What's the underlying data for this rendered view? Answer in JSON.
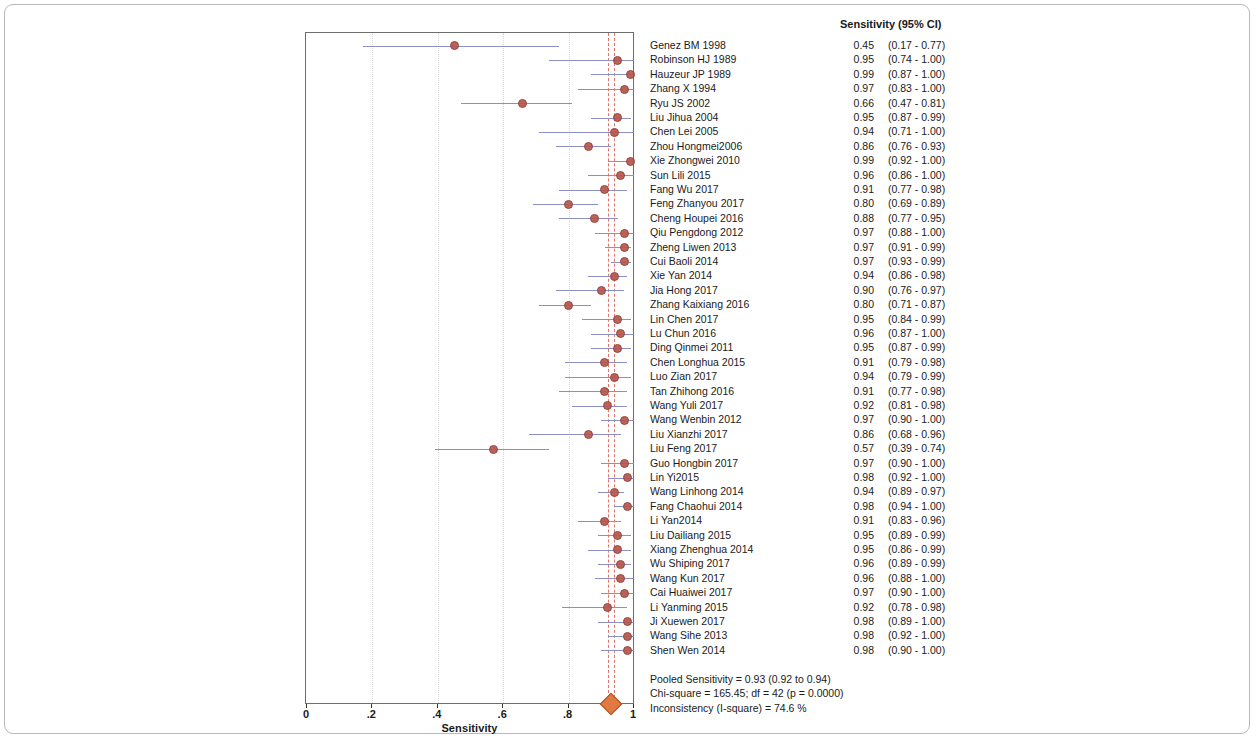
{
  "axis": {
    "title": "Sensitivity",
    "min": 0,
    "max": 1,
    "ticks": [
      "0",
      ".2",
      ".4",
      ".6",
      ".8",
      "1"
    ],
    "tick_values": [
      0,
      0.2,
      0.4,
      0.6,
      0.8,
      1
    ]
  },
  "table": {
    "header": "Sensitivity (95% CI)"
  },
  "colors": {
    "marker": "#b6564c",
    "ci_line": "#8b8fc4",
    "ref_line": "#e0736a",
    "diamond": "#e07a42",
    "frame": "#6d6d6d"
  },
  "summary": {
    "pooled": "Pooled Sensitivity = 0.93 (0.92 to 0.94)",
    "chisq": "Chi-square = 165.45; df =  42 (p = 0.0000)",
    "isquare": "Inconsistency (I-square) = 74.6 %"
  },
  "pooled_marker": {
    "value": 0.93,
    "low": 0.92,
    "high": 0.94
  },
  "ref_lines": [
    0.92,
    0.94
  ],
  "chart_data": {
    "type": "forest",
    "title": "Sensitivity (95% CI)",
    "xlabel": "Sensitivity",
    "ylabel": "",
    "xlim": [
      0,
      1
    ],
    "grid": true,
    "legend": "none",
    "categories": [
      "Genez BM 1998",
      "Robinson HJ 1989",
      "Hauzeur JP 1989",
      "Zhang X 1994",
      "Ryu JS 2002",
      "Liu Jihua 2004",
      "Chen Lei 2005",
      "Zhou Hongmei2006",
      "Xie Zhongwei 2010",
      "Sun Lili 2015",
      "Fang Wu 2017",
      "Feng Zhanyou 2017",
      "Cheng Houpei 2016",
      "Qiu Pengdong 2012",
      "Zheng Liwen 2013",
      "Cui Baoli 2014",
      "Xie Yan 2014",
      "Jia Hong 2017",
      "Zhang Kaixiang 2016",
      "Lin Chen 2017",
      "Lu Chun 2016",
      "Ding Qinmei 2011",
      "Chen Longhua 2015",
      "Luo Zian 2017",
      "Tan Zhihong 2016",
      "Wang Yuli 2017",
      "Wang Wenbin 2012",
      "Liu Xianzhi 2017",
      "Liu Feng 2017",
      "Guo Hongbin 2017",
      "Lin Yi2015",
      "Wang Linhong 2014",
      "Fang Chaohui 2014",
      "Li Yan2014",
      "Liu Dailiang 2015",
      "Xiang Zhenghua 2014",
      "Wu Shiping 2017",
      "Wang Kun 2017",
      "Cai Huaiwei 2017",
      "Li Yanming 2015",
      "Ji Xuewen 2017",
      "Wang Sihe 2013",
      "Shen Wen 2014"
    ],
    "values": [
      0.45,
      0.95,
      0.99,
      0.97,
      0.66,
      0.95,
      0.94,
      0.86,
      0.99,
      0.96,
      0.91,
      0.8,
      0.88,
      0.97,
      0.97,
      0.97,
      0.94,
      0.9,
      0.8,
      0.95,
      0.96,
      0.95,
      0.91,
      0.94,
      0.91,
      0.92,
      0.97,
      0.86,
      0.57,
      0.97,
      0.98,
      0.94,
      0.98,
      0.91,
      0.95,
      0.95,
      0.96,
      0.96,
      0.97,
      0.92,
      0.98,
      0.98,
      0.98
    ],
    "ci_low": [
      0.17,
      0.74,
      0.87,
      0.83,
      0.47,
      0.87,
      0.71,
      0.76,
      0.92,
      0.86,
      0.77,
      0.69,
      0.77,
      0.88,
      0.91,
      0.93,
      0.86,
      0.76,
      0.71,
      0.84,
      0.87,
      0.87,
      0.79,
      0.79,
      0.77,
      0.81,
      0.9,
      0.68,
      0.39,
      0.9,
      0.92,
      0.89,
      0.94,
      0.83,
      0.89,
      0.86,
      0.89,
      0.88,
      0.9,
      0.78,
      0.89,
      0.92,
      0.9
    ],
    "ci_high": [
      0.77,
      1.0,
      1.0,
      1.0,
      0.81,
      0.99,
      1.0,
      0.93,
      1.0,
      1.0,
      0.98,
      0.89,
      0.95,
      1.0,
      0.99,
      0.99,
      0.98,
      0.97,
      0.87,
      0.99,
      1.0,
      0.99,
      0.98,
      0.99,
      0.98,
      0.98,
      1.0,
      0.96,
      0.74,
      1.0,
      1.0,
      0.97,
      1.0,
      0.96,
      0.99,
      0.99,
      0.99,
      1.0,
      1.0,
      0.98,
      1.0,
      1.0,
      1.0
    ],
    "est_labels": [
      "0.45",
      "0.95",
      "0.99",
      "0.97",
      "0.66",
      "0.95",
      "0.94",
      "0.86",
      "0.99",
      "0.96",
      "0.91",
      "0.80",
      "0.88",
      "0.97",
      "0.97",
      "0.97",
      "0.94",
      "0.90",
      "0.80",
      "0.95",
      "0.96",
      "0.95",
      "0.91",
      "0.94",
      "0.91",
      "0.92",
      "0.97",
      "0.86",
      "0.57",
      "0.97",
      "0.98",
      "0.94",
      "0.98",
      "0.91",
      "0.95",
      "0.95",
      "0.96",
      "0.96",
      "0.97",
      "0.92",
      "0.98",
      "0.98",
      "0.98"
    ],
    "ci_labels": [
      "(0.17 - 0.77)",
      "(0.74 - 1.00)",
      "(0.87 - 1.00)",
      "(0.83 - 1.00)",
      "(0.47 - 0.81)",
      "(0.87 - 0.99)",
      "(0.71 - 1.00)",
      "(0.76 - 0.93)",
      "(0.92 - 1.00)",
      "(0.86 - 1.00)",
      "(0.77 - 0.98)",
      "(0.69 - 0.89)",
      "(0.77 - 0.95)",
      "(0.88 - 1.00)",
      "(0.91 - 0.99)",
      "(0.93 - 0.99)",
      "(0.86 - 0.98)",
      "(0.76 - 0.97)",
      "(0.71 - 0.87)",
      "(0.84 - 0.99)",
      "(0.87 - 1.00)",
      "(0.87 - 0.99)",
      "(0.79 - 0.98)",
      "(0.79 - 0.99)",
      "(0.77 - 0.98)",
      "(0.81 - 0.98)",
      "(0.90 - 1.00)",
      "(0.68 - 0.96)",
      "(0.39 - 0.74)",
      "(0.90 - 1.00)",
      "(0.92 - 1.00)",
      "(0.89 - 0.97)",
      "(0.94 - 1.00)",
      "(0.83 - 0.96)",
      "(0.89 - 0.99)",
      "(0.86 - 0.99)",
      "(0.89 - 0.99)",
      "(0.88 - 1.00)",
      "(0.90 - 1.00)",
      "(0.78 - 0.98)",
      "(0.89 - 1.00)",
      "(0.92 - 1.00)",
      "(0.90 - 1.00)"
    ],
    "pooled": {
      "label": "Pooled Sensitivity",
      "value": 0.93,
      "ci_low": 0.92,
      "ci_high": 0.94
    }
  }
}
